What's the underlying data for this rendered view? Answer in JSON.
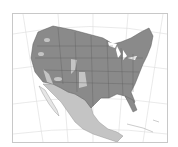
{
  "map": {
    "type": "range map",
    "region": "North America (United States and Mexico)",
    "legend": [],
    "colors": {
      "primary_range": "#8a8a8a",
      "secondary_range": "#c4c4c4",
      "water": "#ffffff",
      "borders": "#5a5a5a",
      "graticule": "#dcdcdc",
      "frame": "#c8c8c8"
    }
  }
}
